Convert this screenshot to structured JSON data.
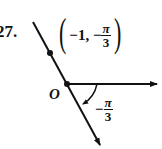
{
  "problem_number": "27.",
  "point_label": {
    "open": "(",
    "r": "−1, −",
    "theta_num": "π",
    "theta_den": "3",
    "close": ")"
  },
  "origin_label": "O",
  "angle_label": {
    "sign": "−",
    "num": "π",
    "den": "3"
  },
  "point": {
    "r": -1,
    "theta": "-π/3"
  }
}
